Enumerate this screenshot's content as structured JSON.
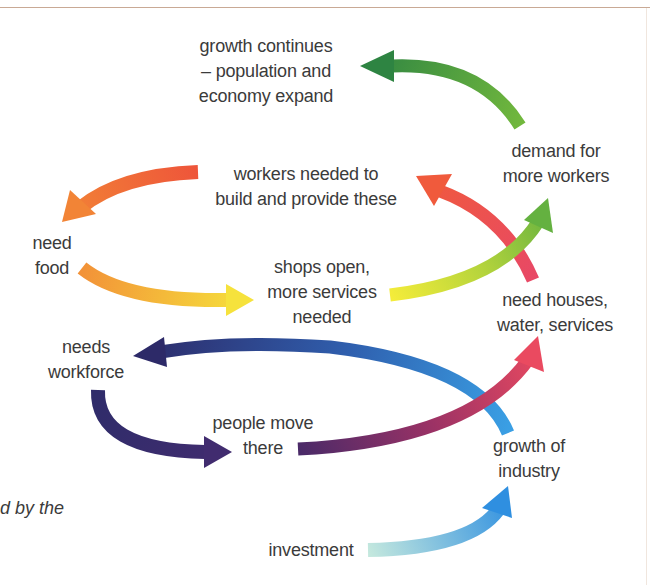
{
  "diagram": {
    "title": "",
    "type": "cycle-flow",
    "nodes": [
      {
        "id": "growth_continues",
        "lines": [
          "growth continues",
          "– population and",
          "economy expand"
        ]
      },
      {
        "id": "demand_workers",
        "lines": [
          "demand for",
          "more workers"
        ]
      },
      {
        "id": "workers_needed",
        "lines": [
          "workers needed to",
          "build and provide these"
        ]
      },
      {
        "id": "need_food",
        "lines": [
          "need",
          "food"
        ]
      },
      {
        "id": "shops_open",
        "lines": [
          "shops open,",
          "more services",
          "needed"
        ]
      },
      {
        "id": "need_houses",
        "lines": [
          "need houses,",
          "water, services"
        ]
      },
      {
        "id": "needs_workforce",
        "lines": [
          "needs",
          "workforce"
        ]
      },
      {
        "id": "people_move",
        "lines": [
          "people move",
          "there"
        ]
      },
      {
        "id": "growth_industry",
        "lines": [
          "growth of",
          "industry"
        ]
      },
      {
        "id": "investment",
        "lines": [
          "investment"
        ]
      }
    ],
    "edges": [
      {
        "from": "investment",
        "to": "growth_industry",
        "colors": [
          "#bfe6dc",
          "#2f8fe0"
        ]
      },
      {
        "from": "growth_industry",
        "to": "needs_workforce",
        "colors": [
          "#3a9be0",
          "#2d2a68"
        ]
      },
      {
        "from": "needs_workforce",
        "to": "people_move",
        "colors": [
          "#2f2c6a",
          "#402c6e"
        ]
      },
      {
        "from": "people_move",
        "to": "need_houses",
        "colors": [
          "#4a2a68",
          "#e9485e"
        ]
      },
      {
        "from": "need_houses",
        "to": "workers_needed",
        "colors": [
          "#e84a62",
          "#ef5a3c"
        ]
      },
      {
        "from": "workers_needed",
        "to": "need_food",
        "colors": [
          "#ee553a",
          "#f28236"
        ]
      },
      {
        "from": "need_food",
        "to": "shops_open",
        "colors": [
          "#f29238",
          "#f6e03a"
        ]
      },
      {
        "from": "shops_open",
        "to": "demand_workers",
        "colors": [
          "#f4ea3a",
          "#67b23f"
        ]
      },
      {
        "from": "demand_workers",
        "to": "growth_continues",
        "colors": [
          "#6db63e",
          "#2e8442"
        ]
      }
    ],
    "caption_fragment": "d by the"
  },
  "colors": {
    "text": "#3b3b3b",
    "top_rule": "#c9a995"
  }
}
